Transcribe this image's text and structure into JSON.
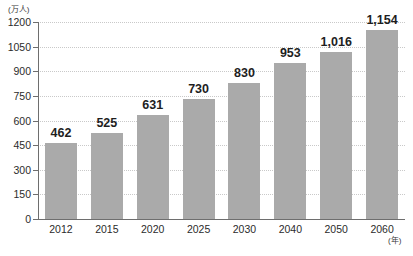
{
  "chart_data": {
    "type": "bar",
    "title": "",
    "xlabel": "(年)",
    "ylabel": "(万人)",
    "categories": [
      "2012",
      "2015",
      "2020",
      "2025",
      "2030",
      "2040",
      "2050",
      "2060"
    ],
    "values": [
      462,
      525,
      631,
      730,
      830,
      953,
      1016,
      1154
    ],
    "value_labels": [
      "462",
      "525",
      "631",
      "730",
      "830",
      "953",
      "1,016",
      "1,154"
    ],
    "ylim": [
      0,
      1200
    ],
    "yticks": [
      0,
      150,
      300,
      450,
      600,
      750,
      900,
      1050,
      1200
    ],
    "ytick_labels": [
      "0",
      "150",
      "300",
      "450",
      "600",
      "750",
      "900",
      "1050",
      "1200"
    ],
    "grid": true,
    "legend": "none",
    "bar_color": "#aaaaaa",
    "axis_color": "#6e6e6e",
    "grid_color": "#c9c9c9",
    "label_color": "#1e1e1e"
  }
}
